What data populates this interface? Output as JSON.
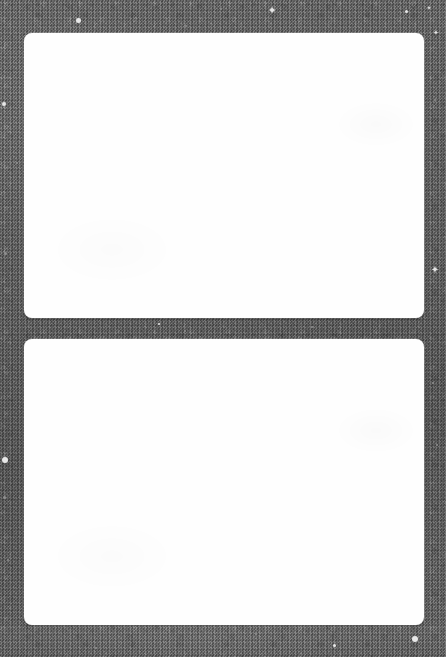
{
  "page": {
    "kind": "scanned-photo-album-page",
    "width": 446,
    "height": 657,
    "background_color": "#5e5e5e",
    "background_description": "dark gray grainy card stock",
    "caption": ""
  },
  "windows": [
    {
      "name": "photo-window-top",
      "label": "",
      "fill_color": "#fefefe",
      "x": 24,
      "y": 33,
      "width": 400,
      "height": 285,
      "corner_radius": 8
    },
    {
      "name": "photo-window-bottom",
      "label": "",
      "fill_color": "#fefefe",
      "x": 24,
      "y": 339,
      "width": 400,
      "height": 286,
      "corner_radius": 8
    }
  ],
  "specks": [
    {
      "x": 78,
      "y": 20,
      "size": 5,
      "tone": "bright"
    },
    {
      "x": 186,
      "y": 26,
      "size": 2,
      "tone": "dim"
    },
    {
      "x": 221,
      "y": 9,
      "size": 2,
      "tone": "dim"
    },
    {
      "x": 406,
      "y": 11,
      "size": 3,
      "tone": "bright"
    },
    {
      "x": 4,
      "y": 104,
      "size": 4,
      "tone": "bright"
    },
    {
      "x": 17,
      "y": 163,
      "size": 2,
      "tone": "dim"
    },
    {
      "x": 5,
      "y": 253,
      "size": 3,
      "tone": "dim"
    },
    {
      "x": 435,
      "y": 100,
      "size": 2,
      "tone": "dim"
    },
    {
      "x": 159,
      "y": 324,
      "size": 2,
      "tone": "bright"
    },
    {
      "x": 312,
      "y": 327,
      "size": 2,
      "tone": "dim"
    },
    {
      "x": 185,
      "y": 331,
      "size": 2,
      "tone": "dim"
    },
    {
      "x": 5,
      "y": 460,
      "size": 6,
      "tone": "bright"
    },
    {
      "x": 4,
      "y": 497,
      "size": 3,
      "tone": "dim"
    },
    {
      "x": 8,
      "y": 560,
      "size": 2,
      "tone": "dim"
    },
    {
      "x": 433,
      "y": 383,
      "size": 2,
      "tone": "dim"
    },
    {
      "x": 437,
      "y": 445,
      "size": 2,
      "tone": "dim"
    },
    {
      "x": 415,
      "y": 639,
      "size": 6,
      "tone": "bright"
    },
    {
      "x": 334,
      "y": 645,
      "size": 3,
      "tone": "bright"
    },
    {
      "x": 96,
      "y": 648,
      "size": 2,
      "tone": "dim"
    },
    {
      "x": 256,
      "y": 634,
      "size": 2,
      "tone": "dim"
    }
  ],
  "star_specks": [
    {
      "x": 272,
      "y": 10,
      "size": 11,
      "glyph": "✦"
    },
    {
      "x": 435,
      "y": 270,
      "size": 10,
      "glyph": "✦"
    },
    {
      "x": 436,
      "y": 33,
      "size": 7,
      "glyph": "✦"
    },
    {
      "x": 429,
      "y": 8,
      "size": 6,
      "glyph": "✦"
    }
  ]
}
